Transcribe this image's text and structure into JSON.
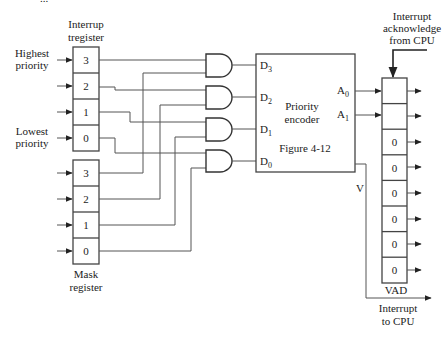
{
  "top_caption_partial": "...",
  "interrupt_register": {
    "title_line1": "Interrup",
    "title_line2": "tregister",
    "cells": [
      "3",
      "2",
      "1",
      "0"
    ]
  },
  "priority_labels": {
    "highest_line1": "Highest",
    "highest_line2": "priority",
    "lowest_line1": "Lowest",
    "lowest_line2": "priority"
  },
  "mask_register": {
    "title_line1": "Mask",
    "title_line2": "register",
    "cells": [
      "3",
      "2",
      "1",
      "0"
    ]
  },
  "encoder": {
    "title_line1": "Priority",
    "title_line2": "encoder",
    "reference": "Figure 4-12",
    "inputs": [
      {
        "letter": "D",
        "sub": "3"
      },
      {
        "letter": "D",
        "sub": "2"
      },
      {
        "letter": "D",
        "sub": "1"
      },
      {
        "letter": "D",
        "sub": "0"
      }
    ],
    "outputs": [
      {
        "letter": "A",
        "sub": "0"
      },
      {
        "letter": "A",
        "sub": "1"
      }
    ],
    "valid_label": "V"
  },
  "vad": {
    "label": "VAD",
    "cells": [
      "",
      "",
      "0",
      "0",
      "0",
      "0",
      "0",
      "0"
    ]
  },
  "ack": {
    "line1": "Interrupt",
    "line2": "acknowledge",
    "line3": "from CPU"
  },
  "interrupt_out": {
    "line1": "Interrupt",
    "line2": "to CPU"
  }
}
